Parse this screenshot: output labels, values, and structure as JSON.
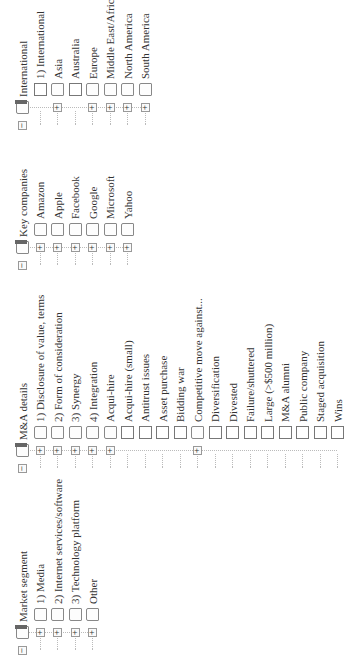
{
  "trees": [
    {
      "label": "Market segment",
      "x": 8,
      "y": 14,
      "children": [
        {
          "label": "1) Media",
          "expandable": true
        },
        {
          "label": "2) Internet services/software",
          "expandable": true
        },
        {
          "label": "3) Technology platform",
          "expandable": true
        },
        {
          "label": "Other",
          "expandable": true
        }
      ]
    },
    {
      "label": "M&A details",
      "x": 190,
      "y": 14,
      "children": [
        {
          "label": "1) Disclosure of value, terms",
          "expandable": true
        },
        {
          "label": "2) Form of consideration",
          "expandable": true
        },
        {
          "label": "3) Synergy",
          "expandable": true
        },
        {
          "label": "4) Integration",
          "expandable": true
        },
        {
          "label": "Acqui-hire",
          "expandable": true
        },
        {
          "label": "Acqui-hire (small)",
          "expandable": false
        },
        {
          "label": "Antitrust issues",
          "expandable": false
        },
        {
          "label": "Asset purchase",
          "expandable": false
        },
        {
          "label": "Bidding war",
          "expandable": false
        },
        {
          "label": "Competitive move against...",
          "expandable": true
        },
        {
          "label": "Diversification",
          "expandable": false
        },
        {
          "label": "Divested",
          "expandable": false
        },
        {
          "label": "Failure/shuttered",
          "expandable": false
        },
        {
          "label": "Large (>$500 million)",
          "expandable": false
        },
        {
          "label": "M&A alumni",
          "expandable": false
        },
        {
          "label": "Public company",
          "expandable": false
        },
        {
          "label": "Staged acquisition",
          "expandable": false
        },
        {
          "label": "Wins",
          "expandable": false
        }
      ]
    },
    {
      "label": "Key companies",
      "x": 393,
      "y": 14,
      "children": [
        {
          "label": "Amazon",
          "expandable": true
        },
        {
          "label": "Apple",
          "expandable": true
        },
        {
          "label": "Facebook",
          "expandable": true
        },
        {
          "label": "Google",
          "expandable": true
        },
        {
          "label": "Microsoft",
          "expandable": true
        },
        {
          "label": "Yahoo",
          "expandable": true
        }
      ]
    },
    {
      "label": "International",
      "x": 533,
      "y": 14,
      "children": [
        {
          "label": "1) International",
          "expandable": false
        },
        {
          "label": "Asia",
          "expandable": true
        },
        {
          "label": "Australia",
          "expandable": false
        },
        {
          "label": "Europe",
          "expandable": true
        },
        {
          "label": "Middle East/Africa",
          "expandable": true
        },
        {
          "label": "North America",
          "expandable": true
        },
        {
          "label": "South America",
          "expandable": true
        }
      ]
    }
  ],
  "icons": {
    "expand": "+",
    "collapse": "−"
  }
}
